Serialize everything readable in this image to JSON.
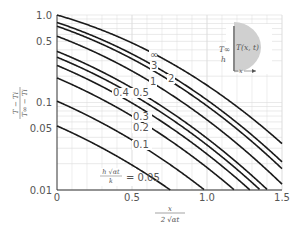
{
  "chart_data": {
    "type": "line",
    "title": "",
    "xlabel": "x / (2√(αt))",
    "ylabel": "(T − Ti) / (T∞ − Ti)",
    "x_scale": "linear",
    "y_scale": "log",
    "xlim": [
      0,
      1.5
    ],
    "ylim": [
      0.01,
      1.0
    ],
    "x_ticks": [
      "0",
      "0.5",
      "1.0",
      "1.5"
    ],
    "y_ticks": [
      "0.01",
      "0.05",
      "0.1",
      "0.5",
      "1.0"
    ],
    "grid": true,
    "parameter_label": "h√(αt)/k",
    "series": [
      {
        "name": "∞",
        "H": 1000
      },
      {
        "name": "3",
        "H": 3
      },
      {
        "name": "2",
        "H": 2
      },
      {
        "name": "1",
        "H": 1
      },
      {
        "name": "0.5",
        "H": 0.5
      },
      {
        "name": "0.4",
        "H": 0.4
      },
      {
        "name": "0.3",
        "H": 0.3
      },
      {
        "name": "0.2",
        "H": 0.2
      },
      {
        "name": "0.1",
        "H": 0.1
      },
      {
        "name": "0.05",
        "H": 0.05
      }
    ],
    "sample_values": {
      "x": [
        0,
        0.5,
        1.0,
        1.5
      ],
      "∞": [
        1.0,
        0.48,
        0.157,
        0.034
      ],
      "3": [
        0.77,
        0.37,
        0.12,
        0.026
      ],
      "2": [
        0.69,
        0.32,
        0.1,
        0.022
      ],
      "1": [
        0.57,
        0.22,
        0.063,
        0.013
      ],
      "0.5": [
        0.38,
        0.14,
        0.036,
        0.007
      ],
      "0.4": [
        0.33,
        0.12,
        0.03,
        0.006
      ],
      "0.3": [
        0.26,
        0.092,
        0.023,
        0.004
      ],
      "0.2": [
        0.19,
        0.064,
        0.016,
        0.003
      ],
      "0.1": [
        0.1,
        0.034,
        0.008,
        0.0015
      ],
      "0.05": [
        0.054,
        0.018,
        0.004,
        0.0008
      ]
    }
  },
  "labels": {
    "y_axis_num": "T − Ti",
    "y_axis_den": "T∞ − Ti",
    "x_axis_num": "x",
    "x_axis_den": "2 √αt",
    "param_num": "h √αt",
    "param_den": "k",
    "param_eq": "= 0.05",
    "inset_tinf": "T∞",
    "inset_h": "h",
    "inset_txt": "T(x, t)",
    "inset_x": "x"
  }
}
